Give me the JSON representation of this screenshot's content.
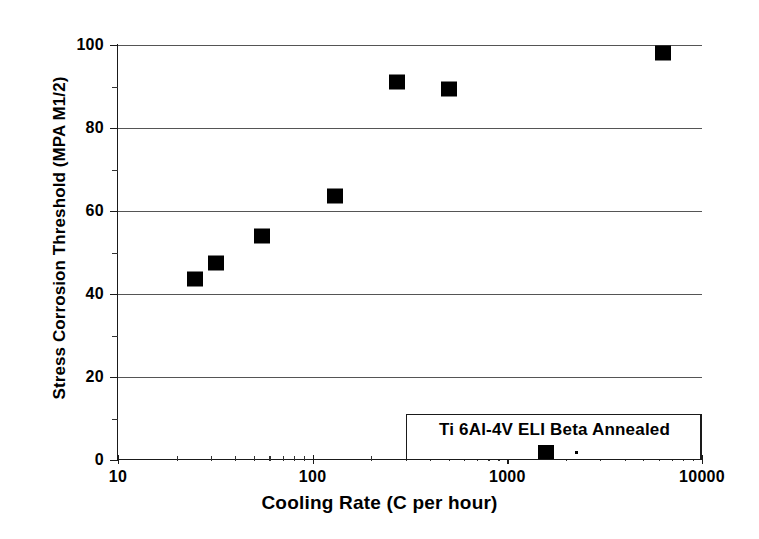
{
  "chart_data": {
    "type": "scatter",
    "title": "",
    "xlabel": "Cooling Rate  (C per hour)",
    "ylabel": "Stress Corrosion Threshold (MPA M1/2)",
    "xscale": "log",
    "yscale": "linear",
    "xlim": [
      10,
      10000
    ],
    "ylim": [
      0,
      100
    ],
    "grid": "horizontal",
    "legend_position": "bottom-right",
    "series": [
      {
        "name": "Ti 6Al-4V ELI Beta Annealed",
        "marker": "filled-square",
        "color": "#000000",
        "points": [
          {
            "x": 25,
            "y": 43.5
          },
          {
            "x": 32,
            "y": 47.5
          },
          {
            "x": 55,
            "y": 54
          },
          {
            "x": 130,
            "y": 63.5
          },
          {
            "x": 270,
            "y": 91
          },
          {
            "x": 500,
            "y": 89.5
          },
          {
            "x": 6300,
            "y": 98
          }
        ]
      }
    ],
    "x_ticks_major": [
      {
        "value": 10,
        "label": "10"
      },
      {
        "value": 100,
        "label": "100"
      },
      {
        "value": 1000,
        "label": "1000"
      },
      {
        "value": 10000,
        "label": "10000"
      }
    ],
    "x_ticks_minor": [
      20,
      30,
      40,
      50,
      60,
      70,
      80,
      90,
      200,
      300,
      400,
      500,
      600,
      700,
      800,
      900,
      2000,
      3000,
      4000,
      5000,
      6000,
      7000,
      8000,
      9000
    ],
    "y_ticks_major": [
      {
        "value": 0,
        "label": "0"
      },
      {
        "value": 20,
        "label": "20"
      },
      {
        "value": 40,
        "label": "40"
      },
      {
        "value": 60,
        "label": "60"
      },
      {
        "value": 80,
        "label": "80"
      },
      {
        "value": 100,
        "label": "100"
      }
    ],
    "y_ticks_minor": [
      10,
      30,
      50,
      70,
      90
    ],
    "gridline_values": [
      20,
      40,
      60,
      80,
      100
    ]
  },
  "legend": {
    "label": "Ti 6Al-4V ELI Beta Annealed",
    "marker_name": "filled-square-marker"
  },
  "axes": {
    "x_title": "Cooling Rate  (C per hour)",
    "y_title": "Stress Corrosion Threshold (MPA M1/2)"
  },
  "colors": {
    "marker": "#000000",
    "axis": "#1a1a1a",
    "grid": "#555555",
    "background": "#ffffff"
  }
}
